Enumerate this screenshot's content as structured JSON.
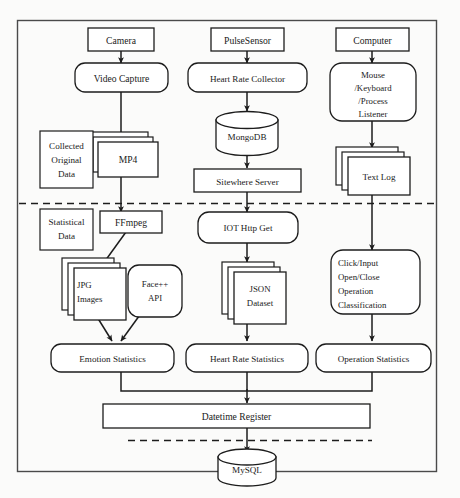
{
  "diagram": {
    "outer_frame": {
      "label": "diagram-border"
    },
    "band_labels": [
      {
        "id": "collected",
        "lines": [
          "Collected",
          "Original",
          "Data"
        ]
      },
      {
        "id": "statistical",
        "lines": [
          "Statistical",
          "Data"
        ]
      }
    ],
    "nodes": [
      {
        "id": "camera",
        "label": "Camera",
        "shape": "rect"
      },
      {
        "id": "video_capture",
        "label": "Video Capture",
        "shape": "rounded"
      },
      {
        "id": "mp4",
        "label": "MP4",
        "shape": "stack"
      },
      {
        "id": "ffmpeg",
        "label": "FFmpeg",
        "shape": "rect"
      },
      {
        "id": "jpg_images",
        "label": "JPG Images",
        "lines": [
          "JPG",
          "Images"
        ],
        "shape": "stack"
      },
      {
        "id": "face_api",
        "label": "Face++ API",
        "lines": [
          "Face++",
          "API"
        ],
        "shape": "rounded"
      },
      {
        "id": "emotion_stats",
        "label": "Emotion Statistics",
        "shape": "rounded"
      },
      {
        "id": "pulse_sensor",
        "label": "PulseSensor",
        "shape": "rect"
      },
      {
        "id": "hr_collector",
        "label": "Heart Rate Collector",
        "shape": "rounded"
      },
      {
        "id": "mongodb",
        "label": "MongoDB",
        "shape": "cylinder"
      },
      {
        "id": "sitewhere",
        "label": "Sitewhere Server",
        "shape": "rect"
      },
      {
        "id": "iot_http_get",
        "label": "IOT Http Get",
        "shape": "rounded"
      },
      {
        "id": "json_dataset",
        "label": "JSON Dataset",
        "lines": [
          "JSON",
          "Dataset"
        ],
        "shape": "stack"
      },
      {
        "id": "hr_stats",
        "label": "Heart Rate Statistics",
        "shape": "rounded"
      },
      {
        "id": "computer",
        "label": "Computer",
        "shape": "rect"
      },
      {
        "id": "listener",
        "label": "Mouse /Keyboard /Process Listener",
        "lines": [
          "Mouse",
          "/Keyboard",
          "/Process",
          "Listener"
        ],
        "shape": "rounded"
      },
      {
        "id": "text_log",
        "label": "Text Log",
        "shape": "stack"
      },
      {
        "id": "op_classification",
        "label": "Click/Input Open/Close Operation Classification",
        "lines": [
          "Click/Input",
          "Open/Close",
          "Operation",
          "Classification"
        ],
        "shape": "rounded"
      },
      {
        "id": "op_stats",
        "label": "Operation Statistics",
        "shape": "rounded"
      },
      {
        "id": "datetime_register",
        "label": "Datetime Register",
        "shape": "rect"
      },
      {
        "id": "mysql",
        "label": "MySQL",
        "shape": "cylinder"
      }
    ],
    "edges": [
      {
        "from": "camera",
        "to": "video_capture"
      },
      {
        "from": "video_capture",
        "to": "mp4"
      },
      {
        "from": "mp4",
        "to": "ffmpeg"
      },
      {
        "from": "ffmpeg",
        "to": "jpg_images"
      },
      {
        "from": "jpg_images",
        "to": "emotion_stats"
      },
      {
        "from": "face_api",
        "to": "emotion_stats"
      },
      {
        "from": "pulse_sensor",
        "to": "hr_collector"
      },
      {
        "from": "hr_collector",
        "to": "mongodb"
      },
      {
        "from": "mongodb",
        "to": "sitewhere"
      },
      {
        "from": "sitewhere",
        "to": "iot_http_get"
      },
      {
        "from": "iot_http_get",
        "to": "json_dataset"
      },
      {
        "from": "json_dataset",
        "to": "hr_stats"
      },
      {
        "from": "computer",
        "to": "listener"
      },
      {
        "from": "listener",
        "to": "text_log"
      },
      {
        "from": "text_log",
        "to": "op_classification"
      },
      {
        "from": "op_classification",
        "to": "op_stats"
      },
      {
        "from": "emotion_stats",
        "to": "datetime_register"
      },
      {
        "from": "hr_stats",
        "to": "datetime_register"
      },
      {
        "from": "op_stats",
        "to": "datetime_register"
      },
      {
        "from": "datetime_register",
        "to": "mysql"
      }
    ],
    "dividers": [
      {
        "id": "divider-collected-statistical",
        "style": "dashed"
      },
      {
        "id": "divider-storage",
        "style": "dashed"
      }
    ],
    "colors": {
      "stroke": "#1c1c1c",
      "fill": "#ffffff",
      "text": "#1a1a1a",
      "background": "#fbfbfa"
    }
  }
}
